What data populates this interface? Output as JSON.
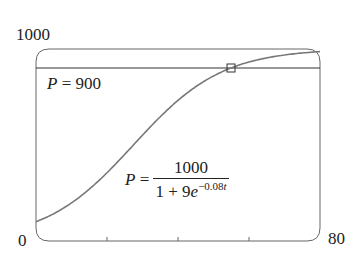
{
  "chart_data": {
    "type": "line",
    "title": "",
    "xlabel": "t",
    "ylabel": "P",
    "xlim": [
      0,
      80
    ],
    "ylim": [
      0,
      1000
    ],
    "x_tick_labels": [
      "0",
      "80"
    ],
    "y_tick_labels": [
      "1000"
    ],
    "x_minor_ticks": [
      20,
      40,
      60
    ],
    "grid": false,
    "series": [
      {
        "name": "P = 1000/(1+9e^(-0.08t))",
        "formula": "1000/(1+9*exp(-0.08*t))",
        "color": "#777777",
        "x": [
          0,
          10,
          20,
          30,
          40,
          50,
          60,
          70,
          80
        ],
        "values": [
          100,
          198,
          355,
          550,
          731,
          858,
          931,
          968,
          985
        ]
      },
      {
        "name": "P = 900",
        "formula": "900",
        "color": "#333333",
        "x": [
          0,
          80
        ],
        "values": [
          900,
          900
        ]
      }
    ],
    "annotations": [
      {
        "type": "marker",
        "shape": "square",
        "x": 54.9,
        "y": 900,
        "label": "intersection"
      },
      {
        "type": "text",
        "text": "P = 900"
      },
      {
        "type": "text",
        "text": "P = 1000 / (1 + 9e^(-0.08t))"
      }
    ]
  },
  "labels": {
    "y_max": "1000",
    "x_min": "0",
    "x_max": "80",
    "hline_P": "P",
    "hline_eq": " = 900",
    "eq_P": "P",
    "eq_equals": " = ",
    "eq_numerator": "1000",
    "eq_denom_pre": "1 + 9",
    "eq_denom_e": "e",
    "eq_denom_exp": "−0.08",
    "eq_denom_t": "t"
  }
}
